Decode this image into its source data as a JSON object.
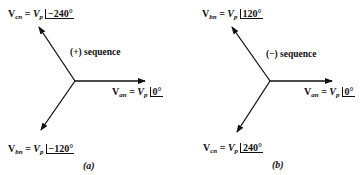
{
  "diagram_a": {
    "sequence_label": "(+) sequence",
    "caption": "(a)",
    "phasors": {
      "cn": {
        "symbol": "V",
        "sub": "cn",
        "eq": " = ",
        "mag": "V",
        "mag_sub": "p",
        "angle": "−240°"
      },
      "an": {
        "symbol": "V",
        "sub": "an",
        "eq": " = ",
        "mag": "V",
        "mag_sub": "p",
        "angle": "0°"
      },
      "bn": {
        "symbol": "V",
        "sub": "bn",
        "eq": " = ",
        "mag": "V",
        "mag_sub": "p",
        "angle": "−120°"
      }
    }
  },
  "diagram_b": {
    "sequence_label": "(−) sequence",
    "caption": "(b)",
    "phasors": {
      "bn": {
        "symbol": "V",
        "sub": "bn",
        "eq": " = ",
        "mag": "V",
        "mag_sub": "p",
        "angle": "120°"
      },
      "an": {
        "symbol": "V",
        "sub": "an",
        "eq": " = ",
        "mag": "V",
        "mag_sub": "p",
        "angle": "0°"
      },
      "cn": {
        "symbol": "V",
        "sub": "cn",
        "eq": " = ",
        "mag": "V",
        "mag_sub": "p",
        "angle": "240°"
      }
    }
  },
  "colors": {
    "ink": "#111111",
    "background": "#ffffff"
  }
}
